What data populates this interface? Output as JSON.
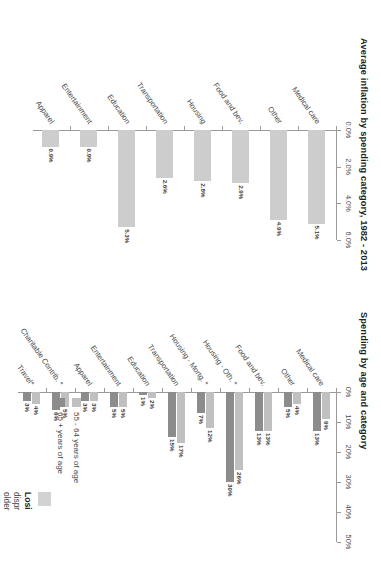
{
  "document": {
    "kind": "scanned-report-page",
    "orientation": "rotated-90-clockwise",
    "background": "#ffffff"
  },
  "palette": {
    "bar_light": "#c9c9c9",
    "bar_mid": "#a8a8a8",
    "bar_dark": "#8a8a8a",
    "axis": "#9a9a9a",
    "text": "#3f3f3f",
    "title": "#231f20"
  },
  "chart_data": [
    {
      "id": "spending-by-age",
      "type": "bar",
      "orientation": "horizontal",
      "title": "Spending by age and category",
      "xlabel": "",
      "ylabel": "",
      "xlim": [
        0,
        50
      ],
      "ticks": [
        "0%",
        "10%",
        "20%",
        "30%",
        "40%",
        "50%"
      ],
      "tick_values": [
        0,
        10,
        20,
        30,
        40,
        50
      ],
      "grid": false,
      "legend_position": "right",
      "categories": [
        "Medical care",
        "Other",
        "Food and bev.",
        "Housing - Oth. *",
        "Housing - Mortg. *",
        "Transportation",
        "Education",
        "Entertainment",
        "Apparel",
        "Charitable Contrib. *",
        "Travel*"
      ],
      "series": [
        {
          "name": "55 - 64 years of age",
          "color": "#c0c0c0",
          "values": [
            9,
            4,
            13,
            26,
            12,
            17,
            2,
            5,
            3,
            5,
            4
          ],
          "labels": [
            "9%",
            "4%",
            "13%",
            "26%",
            "12%",
            "17%",
            "2%",
            "5%",
            "3%",
            "5%",
            "4%"
          ]
        },
        {
          "name": "65 + years of age",
          "color": "#8c8c8c",
          "values": [
            13,
            5,
            13,
            30,
            7,
            15,
            1,
            5,
            3,
            6,
            3
          ],
          "labels": [
            "13%",
            "5%",
            "13%",
            "30%",
            "7%",
            "15%",
            "1%",
            "5%",
            "3%",
            "6%",
            "3%"
          ]
        }
      ]
    },
    {
      "id": "average-inflation",
      "type": "bar",
      "orientation": "horizontal",
      "title": "Average inflation by spending category, 1982 - 2013",
      "xlabel": "",
      "ylabel": "",
      "xlim": [
        0,
        6
      ],
      "ticks": [
        "0.0%",
        "2.0%",
        "4.0%",
        "6.0%"
      ],
      "tick_values": [
        0,
        2,
        4,
        6
      ],
      "grid": false,
      "legend_position": "none",
      "categories": [
        "Medical care",
        "Other",
        "Food and bev.",
        "Housing",
        "Transportation",
        "Education",
        "Entertainment",
        "Apparel"
      ],
      "series": [
        {
          "name": "Average inflation",
          "color": "#cdcdcd",
          "values": [
            5.1,
            4.9,
            2.9,
            2.8,
            2.6,
            5.3,
            0.9,
            0.9
          ],
          "labels": [
            "5.1%",
            "4.9%",
            "2.9%",
            "2.8%",
            "2.6%",
            "5.3%",
            "0.9%",
            "0.9%"
          ]
        }
      ]
    }
  ],
  "legend": {
    "items": [
      {
        "label": "55 - 64 years of age",
        "color": "#c0c0c0"
      },
      {
        "label": "65 + years of age",
        "color": "#8c8c8c"
      }
    ]
  },
  "caption": {
    "swatch_color": "#d2d2d2",
    "heading": "Losi",
    "lines": [
      "dispr",
      "older",
      "differ",
      "habit",
      "in thc"
    ]
  }
}
